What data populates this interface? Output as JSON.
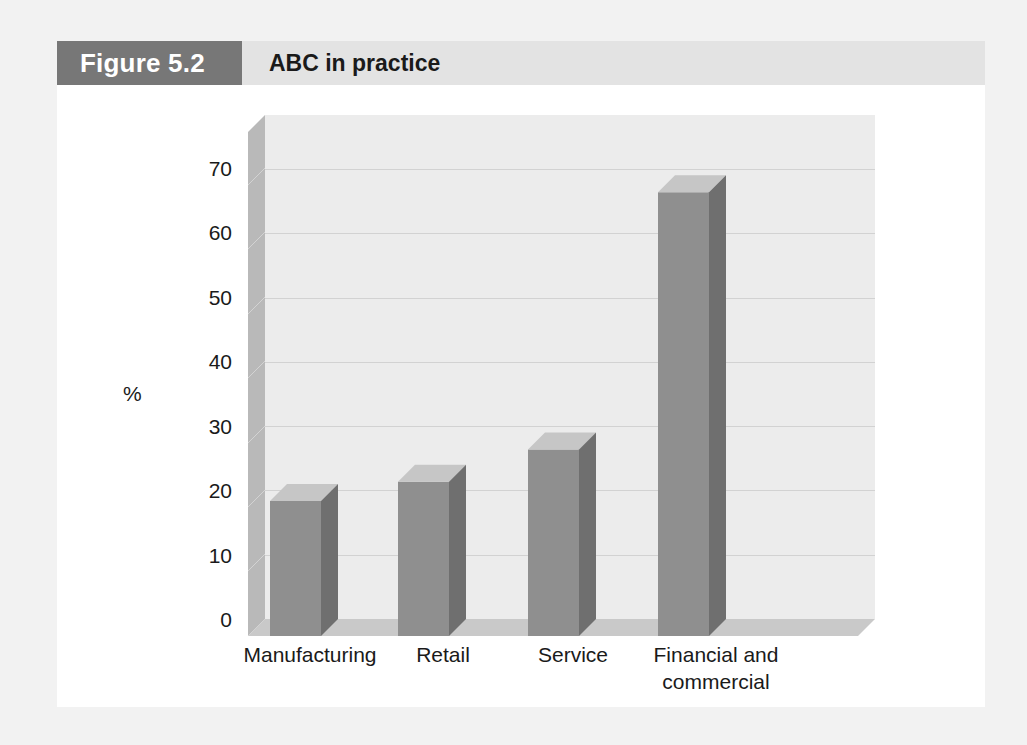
{
  "figure": {
    "number_label": "Figure 5.2",
    "title": "ABC in practice",
    "number_band_color": "#777777",
    "title_band_color": "#e3e3e3",
    "panel_color": "#ffffff",
    "page_background": "#f2f2f2"
  },
  "chart_data": {
    "type": "bar",
    "title": "ABC in practice",
    "categories": [
      "Manufacturing",
      "Retail",
      "Service",
      "Financial and commercial"
    ],
    "category_lines": [
      [
        "Manufacturing"
      ],
      [
        "Retail"
      ],
      [
        "Service"
      ],
      [
        "Financial and",
        "commercial"
      ]
    ],
    "values": [
      21,
      24,
      29,
      69
    ],
    "xlabel": "",
    "ylabel": "%",
    "ylim": [
      0,
      75
    ],
    "yticks": [
      0,
      10,
      20,
      30,
      40,
      50,
      60,
      70
    ],
    "ytick_labels": [
      "0",
      "10",
      "20",
      "30",
      "40",
      "50",
      "60",
      "70"
    ],
    "grid": true,
    "grid_axis": "y",
    "legend": false,
    "style": "3d",
    "bar_face_color": "#8f8f8f",
    "bar_top_color": "#c6c6c6",
    "bar_side_color": "#6f6f6f",
    "plot_back_color": "#ececec",
    "plot_wall_color": "#b9b9b9",
    "plot_floor_color": "#c9c9c9",
    "gridline_color": "#d2d2d2"
  }
}
